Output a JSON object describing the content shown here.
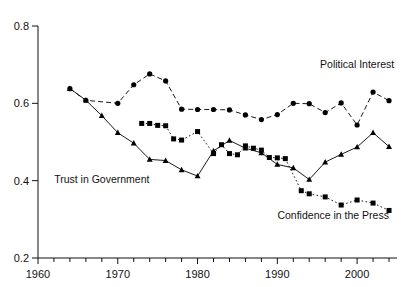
{
  "chart_data": {
    "type": "line",
    "title": "",
    "subtitle": "",
    "xlabel": "",
    "ylabel": "",
    "xlim": [
      1960,
      2005
    ],
    "ylim": [
      0.2,
      0.8
    ],
    "grid": false,
    "legend_position": "inline-annotations",
    "x_ticks_major": [
      1960,
      1970,
      1980,
      1990,
      2000
    ],
    "x_tick_labels": [
      "1960",
      "1970",
      "1980",
      "1990",
      "2000"
    ],
    "x_minor_tick_step": 2,
    "y_ticks": [
      0.2,
      0.4,
      0.6,
      0.8
    ],
    "y_tick_labels": [
      "0.2",
      "0.4",
      "0.6",
      "0.8"
    ],
    "series": [
      {
        "name": "Political Interest",
        "marker": "circle",
        "line_style": "dashed",
        "color": "#000000",
        "annotation": "Political Interest",
        "annotation_x": 2000,
        "annotation_y": 0.692,
        "x": [
          1964,
          1966,
          1970,
          1972,
          1974,
          1976,
          1978,
          1980,
          1982,
          1984,
          1986,
          1988,
          1990,
          1992,
          1994,
          1996,
          1998,
          2000,
          2002,
          2004
        ],
        "y": [
          0.638,
          0.608,
          0.6,
          0.648,
          0.676,
          0.658,
          0.585,
          0.584,
          0.584,
          0.583,
          0.57,
          0.558,
          0.571,
          0.6,
          0.599,
          0.576,
          0.601,
          0.544,
          0.629,
          0.607
        ]
      },
      {
        "name": "Trust in Government",
        "marker": "triangle",
        "line_style": "solid",
        "color": "#000000",
        "annotation": "Trust in Government",
        "annotation_x": 1968,
        "annotation_y": 0.395,
        "x": [
          1964,
          1966,
          1968,
          1970,
          1972,
          1974,
          1976,
          1978,
          1980,
          1982,
          1984,
          1986,
          1988,
          1990,
          1992,
          1994,
          1996,
          1998,
          2000,
          2002,
          2004
        ],
        "y": [
          0.638,
          0.608,
          0.568,
          0.524,
          0.497,
          0.455,
          0.452,
          0.428,
          0.412,
          0.477,
          0.504,
          0.484,
          0.472,
          0.442,
          0.433,
          0.403,
          0.448,
          0.468,
          0.487,
          0.524,
          0.488
        ]
      },
      {
        "name": "Confidence in the Press",
        "marker": "square",
        "line_style": "dotted",
        "color": "#000000",
        "annotation": "Confidence in the Press",
        "annotation_x": 1997,
        "annotation_y": 0.3,
        "x": [
          1973,
          1974,
          1975,
          1976,
          1977,
          1978,
          1980,
          1982,
          1983,
          1984,
          1985,
          1986,
          1987,
          1988,
          1989,
          1990,
          1991,
          1993,
          1994,
          1996,
          1998,
          2000,
          2002,
          2004
        ],
        "y": [
          0.548,
          0.548,
          0.543,
          0.542,
          0.508,
          0.505,
          0.527,
          0.47,
          0.493,
          0.47,
          0.467,
          0.49,
          0.484,
          0.479,
          0.46,
          0.459,
          0.457,
          0.374,
          0.366,
          0.358,
          0.337,
          0.35,
          0.342,
          0.323
        ]
      }
    ]
  },
  "axes": {
    "y_labels": [
      "0.8",
      "0.6",
      "0.4",
      "0.2"
    ],
    "x_labels": [
      "1960",
      "1970",
      "1980",
      "1990",
      "2000"
    ]
  },
  "annotations": {
    "political_interest": "Political Interest",
    "trust_in_government": "Trust in Government",
    "confidence_in_the_press": "Confidence in the Press"
  }
}
